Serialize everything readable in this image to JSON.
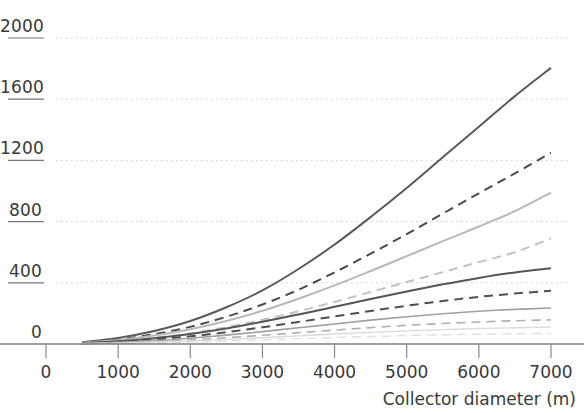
{
  "chart_data": {
    "type": "line",
    "title": "",
    "xlabel": "Collector diameter (m)",
    "ylabel": "",
    "xlim": [
      0,
      7000
    ],
    "ylim": [
      0,
      2000
    ],
    "xticks": [
      0,
      1000,
      2000,
      3000,
      4000,
      5000,
      6000,
      7000
    ],
    "xtick_labels": [
      "0",
      "1000",
      "2000",
      "3000",
      "4000",
      "5000",
      "6000",
      "7000"
    ],
    "yticks": [
      0,
      400,
      800,
      1200,
      1600,
      2000
    ],
    "ytick_labels": [
      "0",
      "400",
      "800",
      "1200",
      "1600",
      "2000"
    ],
    "grid": "horizontal-dotted",
    "legend": "none",
    "x": [
      500,
      1000,
      1500,
      2000,
      2500,
      3000,
      3500,
      4000,
      4500,
      5000,
      5500,
      6000,
      6500,
      7000
    ],
    "series": [
      {
        "name": "series-1",
        "style": "solid",
        "color": "#5a5a5a",
        "width": 2.0,
        "values": [
          12,
          40,
          85,
          150,
          240,
          350,
          490,
          650,
          830,
          1020,
          1220,
          1420,
          1620,
          1805
        ]
      },
      {
        "name": "series-2",
        "style": "dashed",
        "color": "#4a4a4a",
        "width": 2.0,
        "values": [
          9,
          30,
          64,
          112,
          178,
          258,
          355,
          468,
          590,
          718,
          852,
          985,
          1115,
          1250
        ]
      },
      {
        "name": "series-3",
        "style": "solid",
        "color": "#b8b8b8",
        "width": 2.0,
        "values": [
          8,
          26,
          55,
          96,
          150,
          217,
          296,
          383,
          477,
          574,
          672,
          768,
          868,
          990
        ]
      },
      {
        "name": "series-4",
        "style": "dashed",
        "color": "#c2c2c2",
        "width": 2.0,
        "values": [
          6,
          19,
          40,
          70,
          110,
          158,
          214,
          275,
          340,
          405,
          470,
          535,
          600,
          690
        ]
      },
      {
        "name": "series-5",
        "style": "solid",
        "color": "#555555",
        "width": 2.0,
        "values": [
          6,
          18,
          38,
          66,
          102,
          145,
          193,
          243,
          294,
          343,
          390,
          432,
          468,
          495
        ]
      },
      {
        "name": "series-6",
        "style": "dashed",
        "color": "#4f4f4f",
        "width": 2.0,
        "values": [
          5,
          14,
          29,
          50,
          77,
          109,
          144,
          180,
          216,
          250,
          281,
          308,
          330,
          348
        ]
      },
      {
        "name": "series-7",
        "style": "solid",
        "color": "#a0a0a0",
        "width": 1.6,
        "values": [
          4,
          11,
          22,
          38,
          58,
          81,
          106,
          131,
          156,
          178,
          198,
          214,
          226,
          235
        ]
      },
      {
        "name": "series-8",
        "style": "dashed",
        "color": "#b0b0b0",
        "width": 1.6,
        "values": [
          3,
          8,
          16,
          27,
          41,
          57,
          74,
          91,
          107,
          122,
          134,
          144,
          152,
          158
        ]
      },
      {
        "name": "series-9",
        "style": "solid",
        "color": "#dadada",
        "width": 1.4,
        "values": [
          2,
          6,
          12,
          20,
          30,
          41,
          53,
          65,
          76,
          86,
          94,
          101,
          106,
          110
        ]
      },
      {
        "name": "series-10",
        "style": "dashed",
        "color": "#e0e0e0",
        "width": 1.4,
        "values": [
          2,
          4,
          8,
          13,
          20,
          27,
          35,
          42,
          49,
          55,
          60,
          64,
          67,
          70
        ]
      }
    ]
  },
  "axis": {
    "x_title": "Collector diameter (m)"
  },
  "colors": {
    "axis_line": "#3f3f3f",
    "gridline": "#c9c9c9",
    "tick_text": "#3a3a3a",
    "background": "#ffffff"
  }
}
